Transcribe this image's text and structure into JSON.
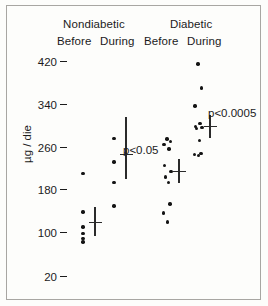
{
  "figure": {
    "y_axis_label": "µg / die",
    "y_ticks": [
      {
        "label": "420",
        "value": 420
      },
      {
        "label": "340",
        "value": 340
      },
      {
        "label": "260",
        "value": 260
      },
      {
        "label": "180",
        "value": 180
      },
      {
        "label": "100",
        "value": 100
      },
      {
        "label": "20",
        "value": 20
      }
    ],
    "groups": [
      {
        "name": "Nondiabetic",
        "columns": [
          "Before",
          "During"
        ]
      },
      {
        "name": "Diabetic",
        "columns": [
          "Before",
          "During"
        ]
      }
    ],
    "annotations": [
      {
        "text": "p<0.05",
        "attached_to": "Nondiabetic During"
      },
      {
        "text": "p<0.0005",
        "attached_to": "Diabetic During"
      }
    ]
  },
  "chart_data": {
    "type": "scatter",
    "title": "",
    "xlabel": "",
    "ylabel": "µg / die",
    "ylim": [
      20,
      420
    ],
    "grid": false,
    "legend": "none",
    "xtick_labels": [
      "Before",
      "During",
      "Before",
      "During"
    ],
    "group_labels": [
      "Nondiabetic",
      "Diabetic"
    ],
    "ytick_labels": [
      "420",
      "340",
      "260",
      "180",
      "100",
      "20"
    ],
    "ytick_values": [
      420,
      340,
      260,
      180,
      100,
      20
    ],
    "annotations": [
      "p<0.05",
      "p<0.0005"
    ],
    "series": [
      {
        "name": "Nondiabetic Before",
        "x_index": 0,
        "values": [
          213,
          141,
          113,
          101,
          92,
          85
        ],
        "mean": 122,
        "error_bar": [
          97,
          150
        ]
      },
      {
        "name": "Nondiabetic During",
        "x_index": 1,
        "values": [
          278,
          234,
          196,
          152
        ],
        "mean": 248,
        "error_bar": [
          203,
          318
        ]
      },
      {
        "name": "Diabetic Before",
        "x_index": 2,
        "values": [
          277,
          272,
          267,
          258,
          228,
          216,
          206,
          196,
          156,
          139,
          122
        ],
        "mean": 216,
        "error_bar": [
          194,
          240
        ]
      },
      {
        "name": "Diabetic During",
        "x_index": 3,
        "values": [
          416,
          372,
          338,
          306,
          300,
          298,
          296,
          274,
          250,
          248,
          246
        ],
        "mean": 300,
        "error_bar": [
          278,
          322
        ]
      }
    ]
  }
}
